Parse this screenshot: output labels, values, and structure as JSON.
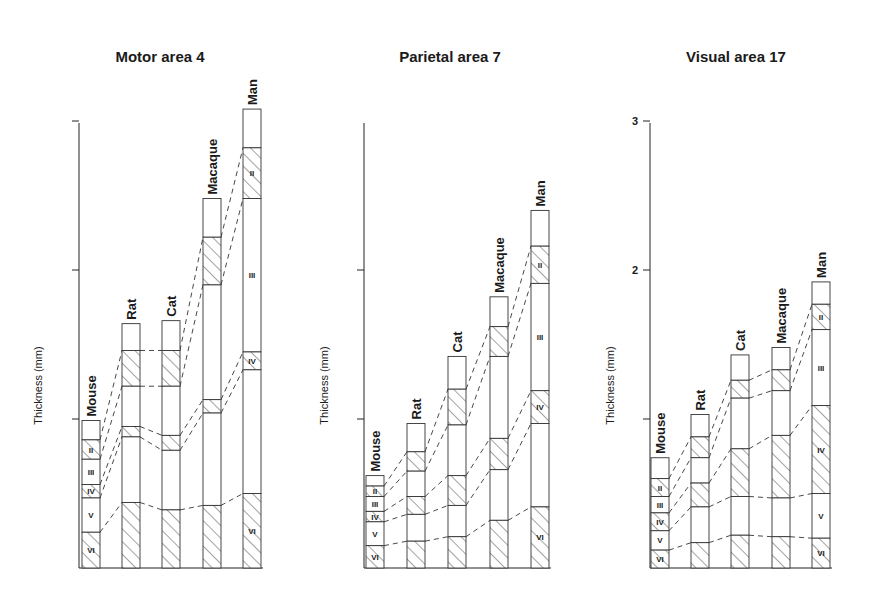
{
  "figure": {
    "ylabel": "Thickness (mm)",
    "layers": [
      "I",
      "II",
      "III",
      "IV",
      "V",
      "VI"
    ],
    "hatched_layers": [
      "II",
      "IV",
      "VI"
    ]
  },
  "chart_data": [
    {
      "type": "bar",
      "subtype": "stacked-layer-columns",
      "title": "Motor area 4",
      "ylabel": "Thickness (mm)",
      "ylim": [
        0,
        3
      ],
      "yticks": [
        1,
        2,
        3
      ],
      "ytick_labels": [
        "",
        "",
        ""
      ],
      "categories": [
        "Mouse",
        "Rat",
        "Cat",
        "Macaque",
        "Man"
      ],
      "layer_boundaries_mm_note": "values are depth-from-white-matter of each layer top: [top(I), top(II), top(III), top(IV), top(V), top(VI)]",
      "columns": [
        {
          "species": "Mouse",
          "boundaries": [
            0.99,
            0.86,
            0.73,
            0.56,
            0.47,
            0.24
          ],
          "labels": [
            "II",
            "III",
            "IV",
            "V",
            "VI"
          ]
        },
        {
          "species": "Rat",
          "boundaries": [
            1.64,
            1.46,
            1.22,
            0.95,
            0.88,
            0.44
          ],
          "labels": []
        },
        {
          "species": "Cat",
          "boundaries": [
            1.66,
            1.46,
            1.22,
            0.89,
            0.79,
            0.39
          ],
          "labels": []
        },
        {
          "species": "Macaque",
          "boundaries": [
            2.48,
            2.22,
            1.9,
            1.13,
            1.04,
            0.42
          ],
          "labels": []
        },
        {
          "species": "Man",
          "boundaries": [
            3.08,
            2.82,
            2.48,
            1.45,
            1.33,
            0.5
          ],
          "labels": [
            "II",
            "III",
            "IV",
            "VI"
          ]
        }
      ],
      "total_thickness": {
        "Mouse": 0.99,
        "Rat": 1.64,
        "Cat": 1.66,
        "Macaque": 2.48,
        "Man": 3.08
      }
    },
    {
      "type": "bar",
      "subtype": "stacked-layer-columns",
      "title": "Parietal area 7",
      "ylabel": "Thickness (mm)",
      "ylim": [
        0,
        3
      ],
      "yticks": [
        1,
        2
      ],
      "ytick_labels": [
        "",
        ""
      ],
      "categories": [
        "Mouse",
        "Rat",
        "Cat",
        "Macaque",
        "Man"
      ],
      "columns": [
        {
          "species": "Mouse",
          "boundaries": [
            0.62,
            0.55,
            0.48,
            0.38,
            0.31,
            0.15
          ],
          "labels": [
            "II",
            "III",
            "IV",
            "V",
            "VI"
          ]
        },
        {
          "species": "Rat",
          "boundaries": [
            0.97,
            0.78,
            0.65,
            0.48,
            0.36,
            0.18
          ],
          "labels": []
        },
        {
          "species": "Cat",
          "boundaries": [
            1.42,
            1.2,
            0.96,
            0.62,
            0.42,
            0.21
          ],
          "labels": []
        },
        {
          "species": "Macaque",
          "boundaries": [
            1.82,
            1.62,
            1.42,
            0.87,
            0.66,
            0.32
          ],
          "labels": []
        },
        {
          "species": "Man",
          "boundaries": [
            2.4,
            2.16,
            1.91,
            1.19,
            0.97,
            0.41
          ],
          "labels": [
            "II",
            "III",
            "IV",
            "VI"
          ]
        }
      ],
      "total_thickness": {
        "Mouse": 0.62,
        "Rat": 0.97,
        "Cat": 1.42,
        "Macaque": 1.82,
        "Man": 2.4
      }
    },
    {
      "type": "bar",
      "subtype": "stacked-layer-columns",
      "title": "Visual area 17",
      "ylabel": "Thickness (mm)",
      "ylim": [
        0,
        3
      ],
      "yticks": [
        1,
        2,
        3
      ],
      "ytick_labels": [
        "",
        "2",
        "3"
      ],
      "categories": [
        "Mouse",
        "Rat",
        "Cat",
        "Macaque",
        "Man"
      ],
      "columns": [
        {
          "species": "Mouse",
          "boundaries": [
            0.74,
            0.6,
            0.48,
            0.37,
            0.25,
            0.12
          ],
          "labels": [
            "II",
            "III",
            "IV",
            "V",
            "VI"
          ]
        },
        {
          "species": "Rat",
          "boundaries": [
            1.03,
            0.88,
            0.74,
            0.57,
            0.41,
            0.17
          ],
          "labels": []
        },
        {
          "species": "Cat",
          "boundaries": [
            1.43,
            1.26,
            1.14,
            0.8,
            0.48,
            0.22
          ],
          "labels": []
        },
        {
          "species": "Macaque",
          "boundaries": [
            1.48,
            1.33,
            1.19,
            0.89,
            0.47,
            0.21
          ],
          "labels": []
        },
        {
          "species": "Man",
          "boundaries": [
            1.92,
            1.77,
            1.6,
            1.09,
            0.5,
            0.2
          ],
          "labels": [
            "II",
            "III",
            "IV",
            "V",
            "VI"
          ]
        }
      ],
      "total_thickness": {
        "Mouse": 0.74,
        "Rat": 1.03,
        "Cat": 1.43,
        "Macaque": 1.48,
        "Man": 1.92
      }
    }
  ],
  "layout": {
    "baseline_y": 568,
    "px_per_mm": 149,
    "bar_width": 18,
    "panels": [
      {
        "axis_x": 79,
        "axis_top": 123,
        "title_x": 160,
        "title_y": 62,
        "ylabel_x": 42,
        "bars_x": [
          82,
          122,
          162,
          203,
          243
        ]
      },
      {
        "axis_x": 364,
        "axis_top": 123,
        "title_x": 450,
        "title_y": 62,
        "ylabel_x": 328,
        "bars_x": [
          366,
          407,
          448,
          490,
          531
        ]
      },
      {
        "axis_x": 650,
        "axis_top": 123,
        "title_x": 736,
        "title_y": 62,
        "ylabel_x": 614,
        "bars_x": [
          651,
          691,
          731,
          772,
          812
        ]
      }
    ]
  }
}
